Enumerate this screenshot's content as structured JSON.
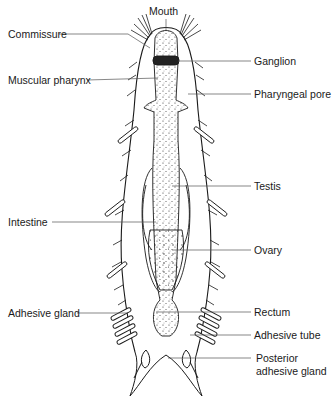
{
  "diagram": {
    "colors": {
      "ink": "#1a1a1a",
      "leader": "#555555",
      "background": "#ffffff"
    },
    "labels": {
      "mouth": "Mouth",
      "commissure": "Commissure",
      "ganglion": "Ganglion",
      "muscular_pharynx": "Muscular pharynx",
      "pharyngeal_pore": "Pharyngeal pore",
      "testis": "Testis",
      "intestine": "Intestine",
      "ovary": "Ovary",
      "adhesive_gland": "Adhesive gland",
      "rectum": "Rectum",
      "adhesive_tube": "Adhesive tube",
      "posterior_adhesive_gland_line1": "Posterior",
      "posterior_adhesive_gland_line2": "adhesive gland"
    }
  }
}
